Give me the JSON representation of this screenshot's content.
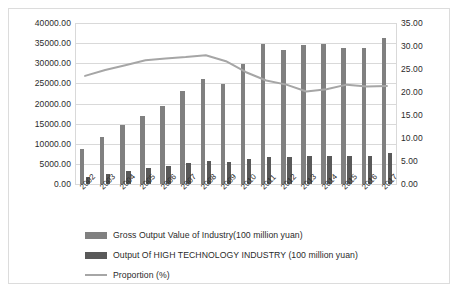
{
  "chart_data": {
    "type": "bar",
    "title": "",
    "xlabel": "",
    "ylabel": "",
    "grid": true,
    "legend_position": "bottom-left",
    "categories": [
      "2002",
      "2003",
      "2004",
      "2005",
      "2006",
      "2007",
      "2008",
      "2009",
      "2010",
      "2011",
      "2012",
      "2013",
      "2014",
      "2015",
      "2016",
      "2017"
    ],
    "left_axis": {
      "ylim": [
        0,
        40000
      ],
      "tick_step": 5000,
      "tick_labels": [
        "0.00",
        "5000.00",
        "10000.00",
        "15000.00",
        "20000.00",
        "25000.00",
        "30000.00",
        "35000.00",
        "40000.00"
      ],
      "unit": "100 million yuan"
    },
    "right_axis": {
      "ylim": [
        0,
        35
      ],
      "tick_step": 5,
      "tick_labels": [
        "0.00",
        "5.00",
        "10.00",
        "15.00",
        "20.00",
        "25.00",
        "30.00",
        "35.00"
      ],
      "unit": "%"
    },
    "series": [
      {
        "name": "Gross Output Value of Industry(100 million yuan)",
        "type": "bar",
        "axis": "left",
        "color": "#808080",
        "values": [
          8600,
          11700,
          14600,
          16900,
          19500,
          23200,
          26000,
          24900,
          29800,
          34800,
          33300,
          34600,
          34900,
          33700,
          33700,
          36300
        ]
      },
      {
        "name": "Output Of HIGH TECHNOLOGY INDUSTRY (100 million yuan)",
        "type": "bar",
        "axis": "left",
        "color": "#595959",
        "values": [
          1800,
          2500,
          3300,
          3900,
          4500,
          5300,
          5800,
          5500,
          6200,
          6800,
          6700,
          6900,
          7000,
          6900,
          6900,
          7600
        ]
      },
      {
        "name": "Proportion (%)",
        "type": "line",
        "axis": "right",
        "color": "#a6a6a6",
        "values": [
          23.5,
          24.8,
          25.8,
          26.9,
          27.3,
          27.6,
          28.0,
          26.7,
          24.3,
          22.5,
          21.6,
          20.1,
          20.6,
          21.6,
          21.2,
          21.3
        ]
      }
    ],
    "legend": [
      {
        "label": "Gross Output Value of Industry(100 million yuan)",
        "marker": "square",
        "color": "#808080"
      },
      {
        "label": "Output Of HIGH TECHNOLOGY INDUSTRY (100 million yuan)",
        "marker": "square",
        "color": "#595959"
      },
      {
        "label": "Proportion (%)",
        "marker": "line",
        "color": "#a6a6a6"
      }
    ]
  }
}
